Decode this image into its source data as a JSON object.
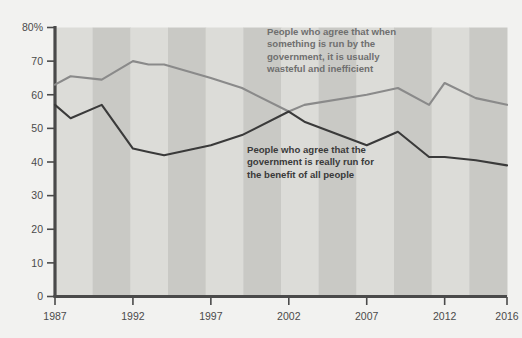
{
  "chart_data": {
    "type": "line",
    "title": "",
    "subtitle": "",
    "xlabel": "",
    "ylabel": "",
    "xlim": [
      1987,
      2016
    ],
    "ylim": [
      0,
      80
    ],
    "grid": false,
    "legend_position": "inline-annotations",
    "y_ticks": [
      "0",
      "10",
      "20",
      "30",
      "40",
      "50",
      "60",
      "70",
      "80%"
    ],
    "y_tick_values": [
      0,
      10,
      20,
      30,
      40,
      50,
      60,
      70,
      80
    ],
    "x_ticks": [
      "1987",
      "1992",
      "1997",
      "2002",
      "2007",
      "2012",
      "2016"
    ],
    "x_tick_values": [
      1987,
      1992,
      1997,
      2002,
      2007,
      2012,
      2016
    ],
    "series": [
      {
        "name": "People who agree that when something is run by the government, it is usually wasteful and inefficient",
        "color": "#8a8a8a",
        "x": [
          1987,
          1988,
          1990,
          1992,
          1993,
          1994,
          1997,
          1999,
          2002,
          2003,
          2007,
          2009,
          2011,
          2012,
          2014,
          2016
        ],
        "values": [
          63,
          65.5,
          64.5,
          70,
          69,
          69,
          65,
          62,
          55,
          57,
          60,
          62,
          57,
          63.5,
          59,
          57
        ]
      },
      {
        "name": "People who agree that the government is really run for the benefit of all people",
        "color": "#3a3a3a",
        "x": [
          1987,
          1988,
          1990,
          1992,
          1993,
          1994,
          1997,
          1999,
          2002,
          2003,
          2007,
          2009,
          2011,
          2012,
          2014,
          2016
        ],
        "values": [
          57,
          53,
          57,
          44,
          43,
          42,
          45,
          48,
          55,
          52,
          45,
          49,
          41.5,
          41.5,
          40.5,
          39
        ]
      }
    ],
    "annotations": [
      {
        "name": "upper-series-annotation",
        "lines": [
          "People who agree that when",
          "something is run by the",
          "government, it is usually",
          "wasteful and inefficient"
        ],
        "color": "#6f6f6f"
      },
      {
        "name": "lower-series-annotation",
        "lines": [
          "People who agree that the",
          "government is really run for",
          "the benefit of all people"
        ],
        "color": "#3a3a3a"
      }
    ],
    "band_colors": [
      "#dcdcd8",
      "#c9c9c5"
    ],
    "band_count": 12,
    "axis_color": "#4a4a4a",
    "background": "#f2f2f0"
  }
}
